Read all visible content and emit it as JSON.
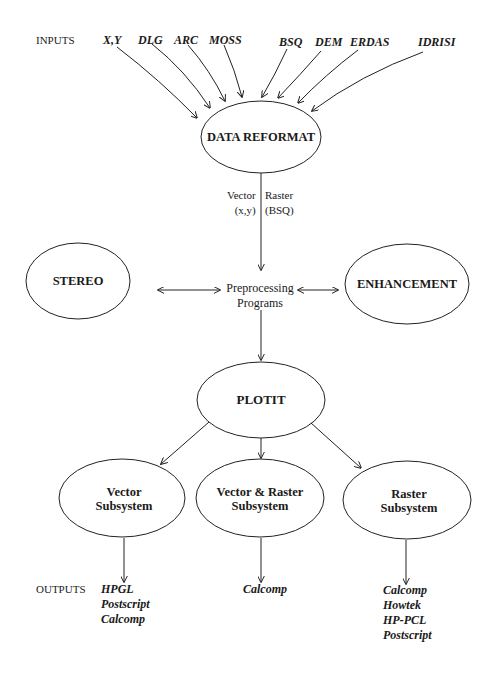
{
  "inputs": {
    "label": "INPUTS",
    "items": [
      "X,Y",
      "DLG",
      "ARC",
      "MOSS",
      "BSQ",
      "DEM",
      "ERDAS",
      "IDRISI"
    ]
  },
  "nodes": {
    "data_reformat": "DATA REFORMAT",
    "stereo": "STEREO",
    "preprocessing_line1": "Preprocessing",
    "preprocessing_line2": "Programs",
    "enhancement": "ENHANCEMENT",
    "plotit": "PLOTIT",
    "vector_subsystem_line1": "Vector",
    "vector_subsystem_line2": "Subsystem",
    "vector_raster_line1": "Vector & Raster",
    "vector_raster_line2": "Subsystem",
    "raster_subsystem_line1": "Raster",
    "raster_subsystem_line2": "Subsystem"
  },
  "edge_labels": {
    "vector_line1": "Vector",
    "vector_line2": "(x,y)",
    "raster_line1": "Raster",
    "raster_line2": "(BSQ)"
  },
  "outputs": {
    "label": "OUTPUTS",
    "vector": [
      "HPGL",
      "Postscript",
      "Calcomp"
    ],
    "vector_raster": [
      "Calcomp"
    ],
    "raster": [
      "Calcomp",
      "Howtek",
      "HP-PCL",
      "Postscript"
    ]
  }
}
